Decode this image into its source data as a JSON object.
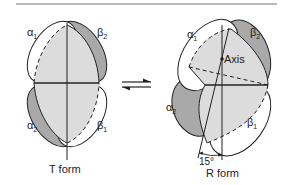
{
  "figure": {
    "colors": {
      "dark_subunit": "#a9a9a9",
      "light_core": "#dcdcdc",
      "white_subunit": "#ffffff",
      "stroke": "#222222",
      "rule": "#777777"
    },
    "t_form": {
      "caption": "T form",
      "subunits": [
        {
          "name": "α",
          "sub": "1",
          "shade": "white"
        },
        {
          "name": "β",
          "sub": "2",
          "shade": "dark"
        },
        {
          "name": "α",
          "sub": "2",
          "shade": "dark"
        },
        {
          "name": "β",
          "sub": "1",
          "shade": "white"
        }
      ]
    },
    "equilibrium_arrows": "⇌",
    "r_form": {
      "caption": "R form",
      "axis_label": "Axis",
      "rotation_angle": "15°",
      "subunits": [
        {
          "name": "α",
          "sub": "1",
          "shade": "white"
        },
        {
          "name": "β",
          "sub": "2",
          "shade": "dark"
        },
        {
          "name": "α",
          "sub": "2",
          "shade": "dark"
        },
        {
          "name": "β",
          "sub": "1",
          "shade": "white"
        }
      ]
    }
  }
}
